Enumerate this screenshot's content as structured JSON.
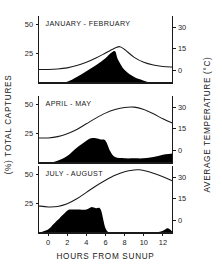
{
  "figure": {
    "x_axis_title": "HOURS FROM SUNUP",
    "left_axis_title": "(%) TOTAL CAPTURES",
    "right_axis_title": "AVERAGE TEMPERATURE (°C)"
  },
  "chart_data": {
    "type": "area",
    "title": "",
    "xlabel": "HOURS FROM SUNUP",
    "ylabel": "(%) TOTAL CAPTURES",
    "y2label": "AVERAGE TEMPERATURE (°C)",
    "xlim": [
      -1,
      13
    ],
    "ylim": [
      0,
      57
    ],
    "y2lim": [
      -9,
      38
    ],
    "xticks": [
      0,
      2,
      4,
      6,
      8,
      10,
      12
    ],
    "xticklabels": [
      "0",
      "2",
      "4",
      "6",
      "8",
      "10",
      "12"
    ],
    "yticks": [
      25,
      50
    ],
    "yticklabels": [
      "25",
      "50"
    ],
    "y2ticks": [
      0,
      15,
      30
    ],
    "y2ticklabels": [
      "0",
      "15",
      "30"
    ],
    "grid": false,
    "legend": null,
    "panels": [
      {
        "label": "JANUARY - FEBRUARY",
        "series": [
          {
            "name": "Total captures (%)",
            "type": "area",
            "axis": "left",
            "x": [
              -1,
              0,
              1,
              2,
              3,
              4,
              5,
              6,
              6.5,
              7,
              7.3,
              8,
              9,
              10,
              11,
              12,
              13
            ],
            "values": [
              0,
              0,
              0,
              1,
              5,
              10,
              15,
              21,
              25,
              27,
              20,
              11,
              5,
              2,
              0,
              0,
              0
            ]
          },
          {
            "name": "Average temperature (°C)",
            "type": "line",
            "axis": "right",
            "x": [
              -1,
              0,
              1,
              2,
              3,
              4,
              5,
              6,
              7,
              7.5,
              8,
              9,
              10,
              11,
              12,
              13
            ],
            "values": [
              0.5,
              0.5,
              0.8,
              1.6,
              3.2,
              5.5,
              8.5,
              12.0,
              15.5,
              16.5,
              14.5,
              9.0,
              5.5,
              3.6,
              2.6,
              2.2
            ]
          }
        ]
      },
      {
        "label": "APRIL - MAY",
        "series": [
          {
            "name": "Total captures (%)",
            "type": "area",
            "axis": "left",
            "x": [
              -1,
              0,
              1,
              2,
              3,
              4,
              4.5,
              5,
              5.5,
              6,
              6.5,
              7,
              8,
              9,
              10,
              11,
              12,
              13
            ],
            "values": [
              0,
              0,
              2,
              6,
              13,
              19,
              21,
              21,
              20,
              19,
              10,
              5,
              4,
              4,
              4,
              5,
              7,
              8
            ]
          },
          {
            "name": "Average temperature (°C)",
            "type": "line",
            "axis": "right",
            "x": [
              -1,
              0,
              1,
              2,
              3,
              4,
              5,
              6,
              7,
              8,
              9,
              10,
              11,
              12,
              13
            ],
            "values": [
              8.5,
              8.6,
              9.5,
              11.5,
              14.5,
              18.5,
              22.5,
              26.0,
              28.5,
              30.0,
              30.2,
              28.5,
              25.5,
              22.0,
              19.0
            ]
          }
        ]
      },
      {
        "label": "JULY - AUGUST",
        "series": [
          {
            "name": "Total captures (%)",
            "type": "area",
            "axis": "left",
            "x": [
              -1,
              0,
              0.5,
              1,
              2,
              2.5,
              3,
              4,
              4.5,
              5,
              5.5,
              6,
              6.5,
              7,
              8,
              9,
              10,
              11,
              12,
              12.5,
              13
            ],
            "values": [
              0,
              3,
              7,
              11,
              19,
              20,
              20,
              20,
              22,
              21,
              20,
              4,
              0,
              0,
              0,
              0,
              0,
              0,
              2,
              4,
              1
            ]
          },
          {
            "name": "Average temperature (°C)",
            "type": "line",
            "axis": "right",
            "x": [
              -1,
              0,
              1,
              2,
              3,
              4,
              5,
              6,
              7,
              8,
              9,
              9.5,
              10,
              11,
              12,
              13
            ],
            "values": [
              10.0,
              9.3,
              9.6,
              11.5,
              15.0,
              19.5,
              24.0,
              28.0,
              31.5,
              34.0,
              35.2,
              35.3,
              34.8,
              33.0,
              30.5,
              27.5
            ]
          }
        ]
      }
    ]
  }
}
